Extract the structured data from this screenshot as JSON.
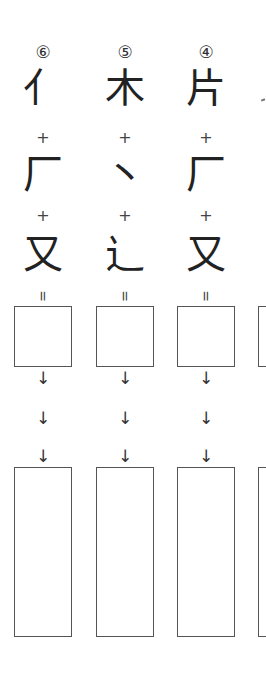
{
  "worksheet": {
    "columns": [
      {
        "number": "⑥",
        "parts": [
          "亻",
          "厂",
          "又"
        ],
        "operators": [
          "+",
          "+"
        ],
        "equals": "=",
        "arrows": [
          "↓",
          "↓",
          "↓"
        ]
      },
      {
        "number": "⑤",
        "parts": [
          "木",
          "丶",
          "辶"
        ],
        "operators": [
          "+",
          "+"
        ],
        "equals": "=",
        "arrows": [
          "↓",
          "↓",
          "↓"
        ]
      },
      {
        "number": "④",
        "parts": [
          "片",
          "厂",
          "又"
        ],
        "operators": [
          "+",
          "+"
        ],
        "equals": "=",
        "arrows": [
          "↓",
          "↓",
          "↓"
        ]
      }
    ]
  }
}
